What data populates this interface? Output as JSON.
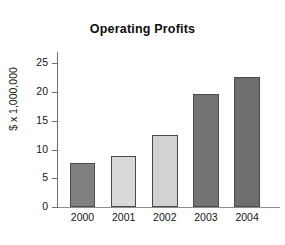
{
  "chart_data": {
    "type": "bar",
    "title": "Operating Profits",
    "xlabel": "",
    "ylabel": "$ x 1,000,000",
    "categories": [
      "2000",
      "2001",
      "2002",
      "2003",
      "2004"
    ],
    "values": [
      7.7,
      8.8,
      12.6,
      19.7,
      22.7
    ],
    "bar_colors": [
      "#808080",
      "#d9d9d9",
      "#d2d2d2",
      "#737373",
      "#6e6e6e"
    ],
    "bar_edge_color": "#4a4a4a",
    "ylim": [
      0,
      27
    ],
    "yticks": [
      0,
      5,
      10,
      15,
      20,
      25
    ],
    "ytick_labels": [
      "0",
      "5",
      "10",
      "15",
      "20",
      "25"
    ],
    "grid": false,
    "legend": null,
    "background": "#ffffff",
    "axis_color": "#6f6f6f"
  }
}
